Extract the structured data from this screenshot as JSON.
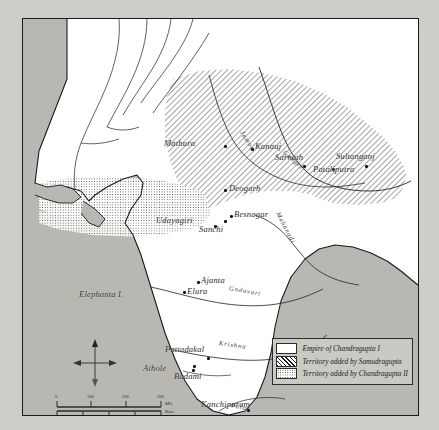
{
  "map": {
    "title": "Gupta Empire Historical Map",
    "sea_color": "#b9b7b2",
    "land_color": "#ffffff",
    "ink_color": "#1d1d1d",
    "paper_color": "#cfcdc8"
  },
  "legend": {
    "items": [
      {
        "pattern": "plain",
        "label": "Empire of Chandragupta I"
      },
      {
        "pattern": "hatch",
        "label": "Territory added by Samudragupta"
      },
      {
        "pattern": "dot",
        "label": "Territory added by Chandragupta II"
      }
    ]
  },
  "cities": [
    {
      "name": "Mathura",
      "x": 160,
      "y": 125,
      "dot_x": 203,
      "dot_y": 128,
      "align": "right"
    },
    {
      "name": "Kanauj",
      "x": 234,
      "y": 128,
      "dot_x": 230,
      "dot_y": 131,
      "align": "left"
    },
    {
      "name": "Sarnath",
      "x": 272,
      "y": 139,
      "dot_x": 282,
      "dot_y": 148,
      "align": "left"
    },
    {
      "name": "Sultanganj",
      "x": 335,
      "y": 139,
      "dot_x": 344,
      "dot_y": 148,
      "align": "left"
    },
    {
      "name": "Pataliputra",
      "x": 313,
      "y": 152,
      "dot_x": 311,
      "dot_y": 151,
      "align": "left"
    },
    {
      "name": "Deogarh",
      "x": 208,
      "y": 170,
      "dot_x": 203,
      "dot_y": 172,
      "align": "left"
    },
    {
      "name": "Besnagar",
      "x": 213,
      "y": 193,
      "dot_x": 209,
      "dot_y": 198,
      "align": "left"
    },
    {
      "name": "Udayagiri",
      "x": 152,
      "y": 204,
      "dot_x": 203,
      "dot_y": 203,
      "align": "left"
    },
    {
      "name": "Sanchi",
      "x": 197,
      "y": 211,
      "dot_x": 193,
      "dot_y": 208,
      "align": "left"
    },
    {
      "name": "Ajanta",
      "x": 180,
      "y": 262,
      "dot_x": 176,
      "dot_y": 264,
      "align": "left"
    },
    {
      "name": "Elura",
      "x": 166,
      "y": 273,
      "dot_x": 162,
      "dot_y": 274,
      "align": "left"
    },
    {
      "name": "Pattadakal",
      "x": 167,
      "y": 328,
      "dot_x": 186,
      "dot_y": 340,
      "align": "left"
    },
    {
      "name": "Aihole",
      "x": 143,
      "y": 348,
      "dot_x": 172,
      "dot_y": 348,
      "align": "left"
    },
    {
      "name": "Badami",
      "x": 175,
      "y": 355,
      "dot_x": 171,
      "dot_y": 352,
      "align": "left"
    },
    {
      "name": "Kanchipuram",
      "x": 203,
      "y": 385,
      "dot_x": 226,
      "dot_y": 392,
      "align": "left"
    }
  ],
  "places": [
    {
      "name": "Elephanta I.",
      "x": 78,
      "y": 288
    }
  ],
  "rivers": [
    {
      "name": "Jumna",
      "x": 236,
      "y": 132,
      "rotate": -58
    },
    {
      "name": "Ganges",
      "x": 283,
      "y": 149,
      "rotate": -40
    },
    {
      "name": "Mahanadi",
      "x": 272,
      "y": 222,
      "rotate": 62
    },
    {
      "name": "Godavari",
      "x": 228,
      "y": 281,
      "rotate": 10
    },
    {
      "name": "Krishna",
      "x": 218,
      "y": 331,
      "rotate": 8
    },
    {
      "name": "Palar",
      "x": 230,
      "y": 400,
      "rotate": 12
    }
  ],
  "compass": {
    "north_label": "N"
  },
  "scale": {
    "miles_unit": "Mls",
    "kms_unit": "Kms",
    "miles_ticks": [
      "0",
      "100",
      "200",
      "300"
    ],
    "kms_ticks": [
      "0",
      "200",
      "400",
      "500"
    ]
  }
}
